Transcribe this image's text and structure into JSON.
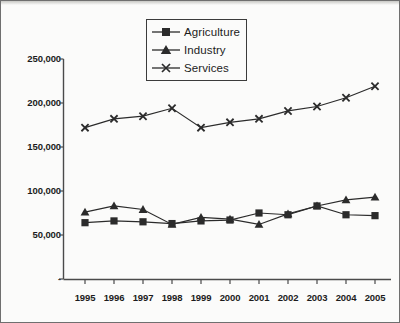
{
  "chart_data": {
    "type": "line",
    "title": "",
    "xlabel": "",
    "ylabel": "",
    "categories": [
      "1995",
      "1996",
      "1997",
      "1998",
      "1999",
      "2000",
      "2001",
      "2002",
      "2003",
      "2004",
      "2005"
    ],
    "series": [
      {
        "name": "Agriculture",
        "marker": "square",
        "values": [
          64000,
          66000,
          65000,
          63000,
          66000,
          67000,
          75000,
          73000,
          83000,
          73000,
          72000
        ]
      },
      {
        "name": "Industry",
        "marker": "triangle",
        "values": [
          76000,
          83000,
          79000,
          62000,
          70000,
          68000,
          62000,
          74000,
          83000,
          90000,
          93000
        ]
      },
      {
        "name": "Services",
        "marker": "x",
        "values": [
          172000,
          182000,
          185000,
          194000,
          172000,
          178000,
          182000,
          191000,
          196000,
          206000,
          219000
        ]
      }
    ],
    "ytick_labels": [
      "250,000",
      "200,000",
      "150,000",
      "100,000",
      "50,000",
      "-"
    ],
    "ytick_values": [
      250000,
      200000,
      150000,
      100000,
      50000,
      0
    ],
    "ylim": [
      0,
      250000
    ],
    "grid": false,
    "legend_position": "top-center",
    "line_color": "#2b2b2b",
    "axis_color": "#4a4a4a",
    "background_color": "#fbfbfa"
  },
  "legend": {
    "items": [
      {
        "label": "Agriculture"
      },
      {
        "label": "Industry"
      },
      {
        "label": "Services"
      }
    ]
  }
}
